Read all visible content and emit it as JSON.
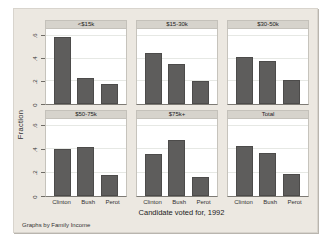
{
  "chart_data": {
    "type": "bar",
    "title": "",
    "categories": [
      "Clinton",
      "Bush",
      "Perot"
    ],
    "panels": [
      {
        "title": "<$15k",
        "values": [
          0.59,
          0.23,
          0.18
        ]
      },
      {
        "title": "$15-30k",
        "values": [
          0.45,
          0.35,
          0.2
        ]
      },
      {
        "title": "$30-50k",
        "values": [
          0.41,
          0.38,
          0.21
        ]
      },
      {
        "title": "$50-75k",
        "values": [
          0.4,
          0.42,
          0.18
        ]
      },
      {
        "title": "$75k+",
        "values": [
          0.36,
          0.48,
          0.16
        ]
      },
      {
        "title": "Total",
        "values": [
          0.43,
          0.37,
          0.19
        ]
      }
    ],
    "ylabel": "Fraction",
    "xlabel": "Candidate voted for, 1992",
    "note": "Graphs by Family Income",
    "yticks": [
      "0",
      ".2",
      ".4",
      ".6"
    ],
    "ylim": [
      0,
      0.66
    ],
    "grid": true,
    "legend": "none",
    "colors": {
      "bar": "#5e5d5c",
      "figure_background": "#ece8e1",
      "panel_header": "#d6d3cc",
      "plot_background": "#ffffff",
      "gridline": "#e6e8e4"
    }
  }
}
